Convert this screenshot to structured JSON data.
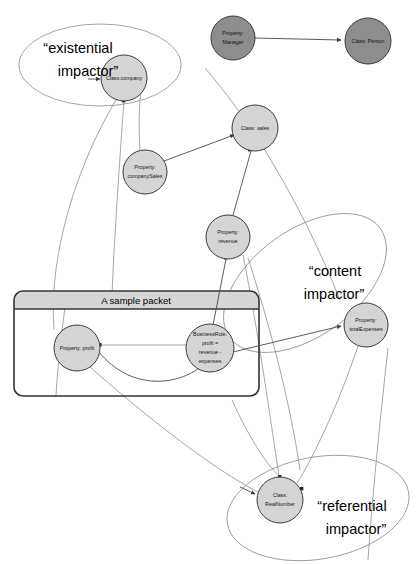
{
  "diagram": {
    "colors": {
      "node_light": "#d4d4d4",
      "node_dark": "#8d8d8d",
      "node_stroke": "#3b3b3b",
      "edge": "#4a4a4a",
      "ellipse": "#9a9a9a",
      "packet_border": "#333333",
      "packet_header": "#d6d6d6",
      "background": "#ffffff"
    },
    "nodes": [
      {
        "id": "company",
        "label": "Class:company",
        "label2": "",
        "label3": "",
        "label4": "",
        "cx": 124,
        "cy": 78,
        "r": 23,
        "fill": "light",
        "lines": 1
      },
      {
        "id": "manager",
        "label": "Property:",
        "label2": "Manager",
        "label3": "",
        "label4": "",
        "cx": 233,
        "cy": 38,
        "r": 22,
        "fill": "dark",
        "lines": 2
      },
      {
        "id": "person",
        "label": "Class: Person",
        "label2": "",
        "label3": "",
        "label4": "",
        "cx": 368,
        "cy": 41,
        "r": 23,
        "fill": "dark",
        "lines": 1
      },
      {
        "id": "sales",
        "label": "Class: sales",
        "label2": "",
        "label3": "",
        "label4": "",
        "cx": 255,
        "cy": 128,
        "r": 23,
        "fill": "light",
        "lines": 1
      },
      {
        "id": "companySales",
        "label": "Property:",
        "label2": "companySales",
        "label3": "",
        "label4": "",
        "cx": 145,
        "cy": 172,
        "r": 22,
        "fill": "light",
        "lines": 2
      },
      {
        "id": "revenue",
        "label": "Property:",
        "label2": "revenue",
        "label3": "",
        "label4": "",
        "cx": 228,
        "cy": 237,
        "r": 22,
        "fill": "light",
        "lines": 2
      },
      {
        "id": "totalExpenses",
        "label": "Property:",
        "label2": "totalExpenses",
        "label3": "",
        "label4": "",
        "cx": 366,
        "cy": 325,
        "r": 22,
        "fill": "light",
        "lines": 2
      },
      {
        "id": "profit",
        "label": "Property: profit",
        "label2": "",
        "label3": "",
        "label4": "",
        "cx": 77,
        "cy": 348,
        "r": 23,
        "fill": "light",
        "lines": 1
      },
      {
        "id": "businessRule",
        "label": "BusinessRule:",
        "label2": "profit =",
        "label3": "revenue -",
        "label4": "expenses",
        "cx": 210,
        "cy": 348,
        "r": 24,
        "fill": "light",
        "lines": 4
      },
      {
        "id": "realNumber",
        "label": "Class:",
        "label2": "RealNumber",
        "label3": "",
        "label4": "",
        "cx": 280,
        "cy": 500,
        "r": 23,
        "fill": "light",
        "lines": 2
      }
    ],
    "impactors": [
      {
        "id": "existential",
        "line1": "“existential",
        "line2": "impactor”",
        "cx": 100,
        "cy": 65,
        "rx": 81,
        "ry": 41,
        "rotate": 0,
        "tx": 78,
        "ty": 48
      },
      {
        "id": "content",
        "line1": "“content",
        "line2": "impactor”",
        "cx": 305,
        "cy": 283,
        "rx": 93,
        "ry": 53,
        "rotate": -36,
        "tx": 327,
        "ty": 272
      },
      {
        "id": "referential",
        "line1": "“referential",
        "line2": "impactor”",
        "cx": 318,
        "cy": 508,
        "rx": 92,
        "ry": 51,
        "rotate": -10,
        "tx": 343,
        "ty": 511
      }
    ],
    "packet": {
      "title": "A sample packet",
      "x": 14,
      "y": 291,
      "width": 245,
      "height": 105,
      "header_height": 18
    },
    "edges": [
      {
        "from": "manager",
        "to": "person",
        "style": "straight"
      },
      {
        "from": "companySales",
        "to": "sales",
        "style": "straight"
      },
      {
        "from": "sales",
        "to": "revenue",
        "style": "straight"
      },
      {
        "from": "revenue",
        "to": "businessRule",
        "style": "straight"
      },
      {
        "from": "businessRule",
        "to": "profit",
        "style": "straight"
      },
      {
        "from": "businessRule",
        "to": "totalExpenses",
        "style": "straight"
      },
      {
        "from": "profit",
        "to": "businessRule",
        "style": "curved"
      },
      {
        "from": "company",
        "to": "companySales",
        "style": "straight"
      },
      {
        "from": "profit",
        "to": "realNumber",
        "style": "straight"
      },
      {
        "from": "revenue",
        "to": "realNumber",
        "style": "straight"
      },
      {
        "from": "totalExpenses",
        "to": "realNumber",
        "style": "straight"
      },
      {
        "from": "company",
        "to": "profit",
        "style": "long-curve"
      }
    ]
  }
}
